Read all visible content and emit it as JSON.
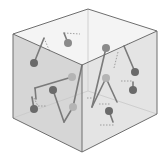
{
  "diagram": {
    "kind": "3d-cube-with-molecular-sticks",
    "colors": {
      "background": "#ffffff",
      "top_face": "#f4f4f4",
      "left_face": "#d6d6d6",
      "right_face": "#e4e4e4",
      "edge": "#6e6e6e",
      "hidden_edge": "#c8c8c8",
      "stick": "#7a7a7a",
      "dashed": "#8c8c8c",
      "ball_dark": "#6a6a6a",
      "ball_medium": "#8a8a8a",
      "ball_light": "#b4b4b4"
    },
    "cube": {
      "top_back": [
        88,
        9
      ],
      "top_left": [
        13,
        34
      ],
      "top_right": [
        157,
        31
      ],
      "top_front": [
        82,
        65
      ],
      "bottom_left": [
        13,
        118
      ],
      "bottom_front": [
        82,
        152
      ],
      "bottom_right": [
        157,
        114
      ],
      "bottom_back": [
        88,
        91
      ]
    },
    "balls": [
      {
        "x": 34,
        "y": 63,
        "r": 4,
        "shade": "dark"
      },
      {
        "x": 68,
        "y": 43,
        "r": 4,
        "shade": "medium"
      },
      {
        "x": 53,
        "y": 90,
        "r": 4,
        "shade": "dark"
      },
      {
        "x": 34,
        "y": 109,
        "r": 4,
        "shade": "dark"
      },
      {
        "x": 72,
        "y": 77,
        "r": 4,
        "shade": "light"
      },
      {
        "x": 73,
        "y": 107,
        "r": 4,
        "shade": "light"
      },
      {
        "x": 106,
        "y": 48,
        "r": 4,
        "shade": "medium"
      },
      {
        "x": 135,
        "y": 72,
        "r": 4,
        "shade": "dark"
      },
      {
        "x": 106,
        "y": 78,
        "r": 4,
        "shade": "light"
      },
      {
        "x": 133,
        "y": 90,
        "r": 4,
        "shade": "dark"
      },
      {
        "x": 109,
        "y": 111,
        "r": 4,
        "shade": "dark"
      }
    ],
    "sticks": [
      [
        [
          34,
          63
        ],
        [
          44,
          38
        ]
      ],
      [
        [
          68,
          43
        ],
        [
          64,
          33
        ]
      ],
      [
        [
          35,
          88
        ],
        [
          72,
          77
        ]
      ],
      [
        [
          35,
          88
        ],
        [
          36,
          99
        ]
      ],
      [
        [
          53,
          90
        ],
        [
          64,
          122
        ]
      ],
      [
        [
          64,
          122
        ],
        [
          73,
          107
        ]
      ],
      [
        [
          73,
          107
        ],
        [
          82,
          65
        ]
      ],
      [
        [
          34,
          109
        ],
        [
          32,
          97
        ]
      ],
      [
        [
          106,
          48
        ],
        [
          92,
          107
        ]
      ],
      [
        [
          92,
          107
        ],
        [
          106,
          78
        ]
      ],
      [
        [
          106,
          78
        ],
        [
          117,
          102
        ]
      ],
      [
        [
          135,
          72
        ],
        [
          124,
          46
        ]
      ],
      [
        [
          133,
          90
        ],
        [
          133,
          82
        ]
      ],
      [
        [
          109,
          111
        ],
        [
          113,
          122
        ]
      ]
    ],
    "dashed": [
      [
        [
          44,
          38
        ],
        [
          50,
          52
        ]
      ],
      [
        [
          64,
          33
        ],
        [
          80,
          34
        ]
      ],
      [
        [
          34,
          98
        ],
        [
          38,
          106
        ],
        [
          46,
          106
        ]
      ],
      [
        [
          124,
          46
        ],
        [
          130,
          43
        ]
      ],
      [
        [
          118,
          52
        ],
        [
          114,
          68
        ]
      ],
      [
        [
          121,
          81
        ],
        [
          132,
          81
        ]
      ],
      [
        [
          99,
          104
        ],
        [
          111,
          104
        ]
      ],
      [
        [
          100,
          125
        ],
        [
          115,
          125
        ]
      ],
      [
        [
          87,
          98
        ],
        [
          92,
          98
        ]
      ]
    ]
  }
}
